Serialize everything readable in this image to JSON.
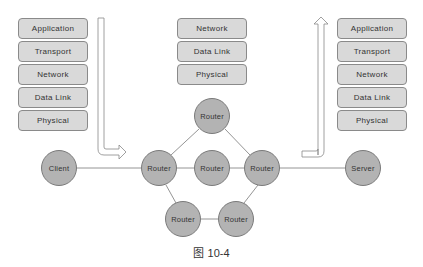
{
  "stacks": {
    "client": {
      "layers": [
        "Application",
        "Transport",
        "Network",
        "Data Link",
        "Physical"
      ]
    },
    "router": {
      "layers": [
        "Network",
        "Data Link",
        "Physical"
      ]
    },
    "server": {
      "layers": [
        "Application",
        "Transport",
        "Network",
        "Data Link",
        "Physical"
      ]
    }
  },
  "nodes": {
    "client": "Client",
    "router_left": "Router",
    "router_center": "Router",
    "router_right": "Router",
    "router_top": "Router",
    "router_bottom_left": "Router",
    "router_bottom_right": "Router",
    "server": "Server"
  },
  "caption": "图 10-4",
  "colors": {
    "node_fill": "#b3b3b3",
    "node_stroke": "#7a7a7a",
    "layer_fill": "#d9d9d9",
    "line": "#888888"
  }
}
